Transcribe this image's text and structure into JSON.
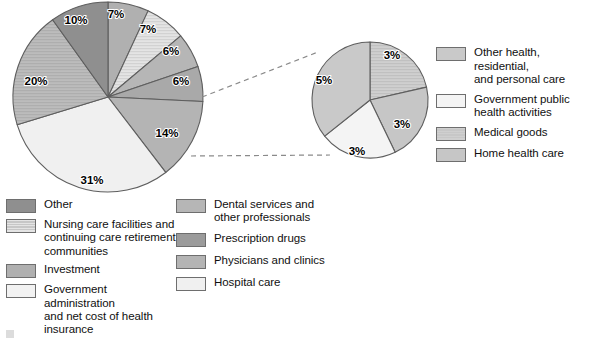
{
  "chart_data": {
    "type": "pie",
    "title": "",
    "charts": [
      {
        "name": "main-pie",
        "labels": [
          "Investment",
          "Nursing care facilities and continuing care retirement communities",
          "Dental services and other professionals",
          "Other health, residential, and personal care; Government public health activities; Medical goods; Home health care",
          "Physicians and clinics",
          "Hospital care",
          "Prescription drugs",
          "Other"
        ],
        "values": [
          7,
          7,
          6,
          6,
          14,
          31,
          20,
          10
        ],
        "display_values": [
          "7%",
          "7%",
          "6%",
          "6%",
          "14%",
          "31%",
          "20%",
          "10%"
        ],
        "colors": [
          "#b0b0b0",
          "#e2e2e2",
          "#b6b6b6",
          "#a9a9a9",
          "#b4b4b4",
          "#f0f0f0",
          "#c0c0c0",
          "#8f8f8f"
        ],
        "start_angle_deg": 0,
        "direction": "clockwise"
      },
      {
        "name": "exploded-pie",
        "labels": [
          "Medical goods",
          "Home health care",
          "Government public health activities",
          "Other health, residential, and personal care"
        ],
        "values": [
          3,
          3,
          3,
          5
        ],
        "display_values": [
          "3%",
          "3%",
          "3%",
          "5%"
        ],
        "colors": [
          "#cfcfcf",
          "#c6c6c6",
          "#f4f4f4",
          "#c9c9c9"
        ],
        "start_angle_deg": 0,
        "direction": "clockwise"
      }
    ]
  },
  "main_pie": {
    "slices": [
      {
        "pct": "7%",
        "value": 7,
        "label_x": 116,
        "label_y": 18,
        "color": "#b0b0b0",
        "pattern": "solid"
      },
      {
        "pct": "7%",
        "value": 7,
        "label_x": 148,
        "label_y": 33,
        "color": "#e4e4e4",
        "pattern": "stripes"
      },
      {
        "pct": "6%",
        "value": 6,
        "label_x": 171,
        "label_y": 55,
        "color": "#b6b6b6",
        "pattern": "solid"
      },
      {
        "pct": "6%",
        "value": 6,
        "label_x": 181,
        "label_y": 85,
        "color": "#a9a9a9",
        "pattern": "solid"
      },
      {
        "pct": "14%",
        "value": 14,
        "label_x": 167,
        "label_y": 137,
        "color": "#b4b4b4",
        "pattern": "solid"
      },
      {
        "pct": "31%",
        "value": 31,
        "label_x": 92,
        "label_y": 184,
        "color": "#f0f0f0",
        "pattern": "solid"
      },
      {
        "pct": "20%",
        "value": 20,
        "label_x": 36,
        "label_y": 85,
        "color": "#bcbcbc",
        "pattern": "stripes"
      },
      {
        "pct": "10%",
        "value": 10,
        "label_x": 76,
        "label_y": 24,
        "color": "#8f8f8f",
        "pattern": "solid"
      }
    ]
  },
  "exploded_pie": {
    "slices": [
      {
        "pct": "3%",
        "value": 3,
        "label_x": 392,
        "label_y": 59,
        "color": "#cfcfcf",
        "pattern": "stripes"
      },
      {
        "pct": "3%",
        "value": 3,
        "label_x": 402,
        "label_y": 128,
        "color": "#c6c6c6",
        "pattern": "solid"
      },
      {
        "pct": "3%",
        "value": 3,
        "label_x": 357,
        "label_y": 155,
        "color": "#f4f4f4",
        "pattern": "solid"
      },
      {
        "pct": "5%",
        "value": 5,
        "label_x": 324,
        "label_y": 84,
        "color": "#c9c9c9",
        "pattern": "solid"
      }
    ]
  },
  "legend_left": {
    "items": [
      {
        "label": "Other",
        "color": "#8f8f8f",
        "pattern": "solid"
      },
      {
        "label": "Nursing care facilities and\ncontinuing care retirement\ncommunities",
        "color": "#e4e4e4",
        "pattern": "stripes"
      },
      {
        "label": "Investment",
        "color": "#b0b0b0",
        "pattern": "solid"
      },
      {
        "label": "Government administration\nand net cost of health\ninsurance",
        "color": "#f2f2f2",
        "pattern": "solid"
      }
    ]
  },
  "legend_mid": {
    "items": [
      {
        "label": "Dental services and\nother professionals",
        "color": "#b6b6b6",
        "pattern": "solid"
      },
      {
        "label": "Prescription drugs",
        "color": "#9b9b9b",
        "pattern": "solid"
      },
      {
        "label": "Physicians and clinics",
        "color": "#b4b4b4",
        "pattern": "solid"
      },
      {
        "label": "Hospital care",
        "color": "#f0f0f0",
        "pattern": "solid"
      }
    ]
  },
  "legend_right": {
    "items": [
      {
        "label": "Other health, residential,\nand personal care",
        "color": "#c9c9c9",
        "pattern": "solid"
      },
      {
        "label": "Government public\nhealth activities",
        "color": "#f4f4f4",
        "pattern": "solid"
      },
      {
        "label": "Medical goods",
        "color": "#cfcfcf",
        "pattern": "stripes"
      },
      {
        "label": "Home health care",
        "color": "#c6c6c6",
        "pattern": "solid"
      }
    ]
  },
  "colors": {
    "outline": "#5e5e5e",
    "swatch_border": "#6e6e6e",
    "connector": "#8a8a8a",
    "text": "#101010",
    "background": "#ffffff"
  }
}
